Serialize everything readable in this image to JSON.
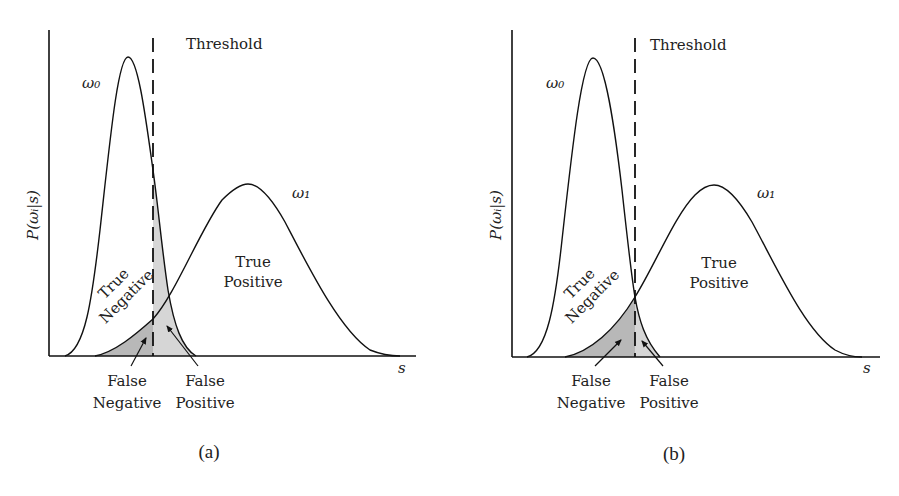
{
  "panels": [
    {
      "id": "a",
      "caption": "(a)",
      "threshold_label": "Threshold",
      "y_axis_label": "P(ωᵢ|s)",
      "x_axis_label": "s",
      "class0_label": "ω₀",
      "class1_label": "ω₁",
      "region_labels": {
        "true_negative": [
          "True",
          "Negative"
        ],
        "true_positive": [
          "True",
          "Positive"
        ],
        "false_negative": [
          "False",
          "Negative"
        ],
        "false_positive": [
          "False",
          "Positive"
        ]
      }
    },
    {
      "id": "b",
      "caption": "(b)",
      "threshold_label": "Threshold",
      "y_axis_label": "P(ωᵢ|s)",
      "x_axis_label": "s",
      "class0_label": "ω₀",
      "class1_label": "ω₁",
      "region_labels": {
        "true_negative": [
          "True",
          "Negative"
        ],
        "true_positive": [
          "True",
          "Positive"
        ],
        "false_negative": [
          "False",
          "Negative"
        ],
        "false_positive": [
          "False",
          "Positive"
        ]
      }
    }
  ],
  "colors": {
    "line": "#111111",
    "false_negative_fill": "#b8b8b8",
    "false_positive_fill": "#d6d6d6"
  }
}
